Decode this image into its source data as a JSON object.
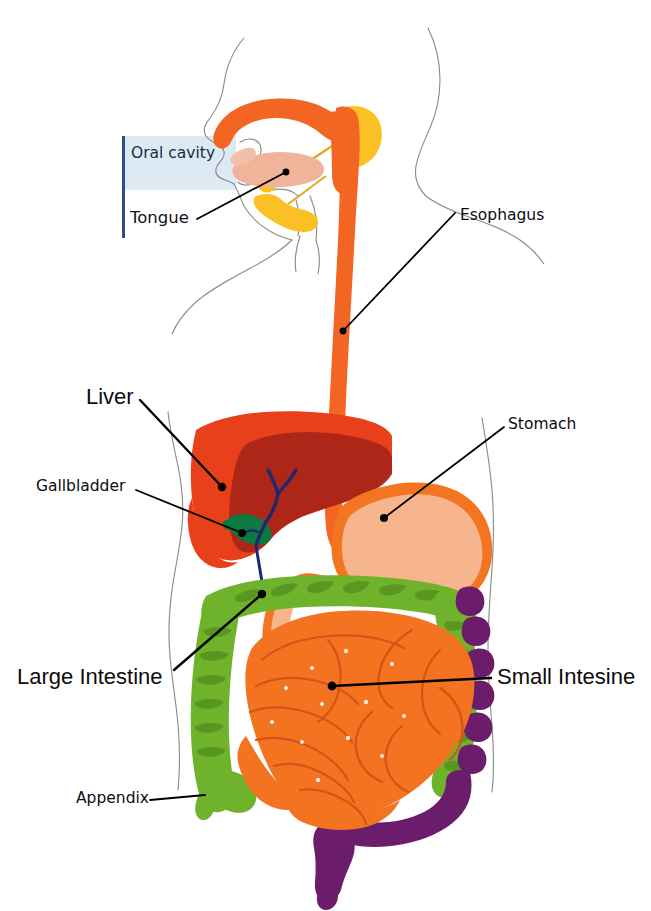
{
  "figure": {
    "background_color": "#ffffff"
  },
  "callout_panel": {
    "bar_color": "#2f4d87",
    "fill_color": "#ddeaf3"
  },
  "labels": [
    {
      "id": "oral_cavity",
      "text": "Oral cavity",
      "color": "#1b2a4a"
    },
    {
      "id": "tongue",
      "text": "Tongue",
      "color": "#111111"
    },
    {
      "id": "esophagus",
      "text": "Esophagus",
      "color": "#0d0d0d"
    },
    {
      "id": "liver",
      "text": "Liver",
      "color": "#0d0d0d"
    },
    {
      "id": "stomach",
      "text": "Stomach",
      "color": "#0d0d0d"
    },
    {
      "id": "gallbladder",
      "text": "Gallbladder",
      "color": "#0d0d0d"
    },
    {
      "id": "large_intestine",
      "text": "Large Intestine",
      "color": "#0d0d0d"
    },
    {
      "id": "small_intestine",
      "text": "Small Intesine",
      "color": "#0d0d0d"
    },
    {
      "id": "appendix",
      "text": "Appendix",
      "color": "#0d0d0d"
    }
  ],
  "organs": {
    "oral_pharynx": {
      "name": "Oral cavity / pharynx",
      "color": "#f26522"
    },
    "tongue": {
      "name": "Tongue",
      "color": "#f0b49a"
    },
    "salivary_glands": {
      "name": "Salivary glands",
      "color": "#fbc024"
    },
    "esophagus": {
      "name": "Esophagus",
      "color": "#f26522"
    },
    "liver": {
      "name": "Liver",
      "color": "#e8401a"
    },
    "liver_lobe_shadow": {
      "name": "Liver right lobe (shaded)",
      "color": "#a82418"
    },
    "gallbladder": {
      "name": "Gallbladder",
      "color": "#0c7a3e"
    },
    "bile_duct": {
      "name": "Bile duct / pancreatic duct",
      "color": "#1b2a6e"
    },
    "stomach_wall": {
      "name": "Stomach wall",
      "color": "#f47521"
    },
    "stomach_lumen": {
      "name": "Stomach lumen",
      "color": "#f6b58c"
    },
    "small_intestine": {
      "name": "Small intestine",
      "color": "#f37321"
    },
    "large_intestine": {
      "name": "Large intestine (colon)",
      "color": "#6fb22c"
    },
    "descending_colon": {
      "name": "Descending colon / rectum",
      "color": "#6b1d6b"
    },
    "appendix": {
      "name": "Appendix",
      "color": "#6fb22c"
    },
    "body_outline": {
      "name": "Body outline",
      "color": "#8a8a8a"
    }
  },
  "leader_lines": {
    "color": "#000000",
    "width": 1.8,
    "dot_radius": 4
  }
}
